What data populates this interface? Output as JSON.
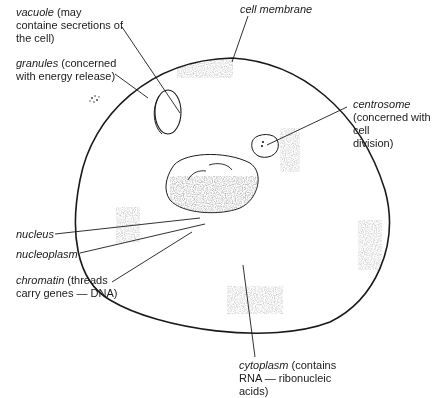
{
  "labels": {
    "vacuole": {
      "term": "vacuole",
      "desc": " (may",
      "line2": "containe secretions of",
      "line3": "the cell)"
    },
    "granules": {
      "term": "granules",
      "desc": " (concerned",
      "line2": "with energy release)"
    },
    "cell_membrane": {
      "term": "cell membrane"
    },
    "centrosome": {
      "term": "centrosome",
      "line2": "(concerned with cell",
      "line3": "division)"
    },
    "nucleus": {
      "term": "nucleus"
    },
    "nucleoplasm": {
      "term": "nucleoplasm"
    },
    "chromatin": {
      "term": "chromatin",
      "desc": " (threads",
      "line2": "carry genes — DNA)"
    },
    "cytoplasm": {
      "term": "cytoplasm",
      "desc": " (contains",
      "line2": "RNA — ribonucleic",
      "line3": "acids)"
    }
  },
  "colors": {
    "ink": "#1a1a1a",
    "stipple": "#8a8a8a",
    "background": "#ffffff"
  }
}
